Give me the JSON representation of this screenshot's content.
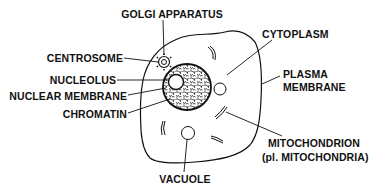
{
  "diagram": {
    "colors": {
      "ink": "#111111",
      "background": "#ffffff"
    },
    "labels": {
      "golgi": "GOLGI APPARATUS",
      "centrosome": "CENTROSOME",
      "nucleolus": "NUCLEOLUS",
      "nuclear_membrane": "NUCLEAR MEMBRANE",
      "chromatin": "CHROMATIN",
      "cytoplasm": "CYTOPLASM",
      "plasma_membrane_1": "PLASMA",
      "plasma_membrane_2": "MEMBRANE",
      "mitochondrion_1": "MITOCHONDRION",
      "mitochondrion_2": "(pl. MITOCHONDRIA)",
      "vacuole": "VACUOLE"
    }
  }
}
